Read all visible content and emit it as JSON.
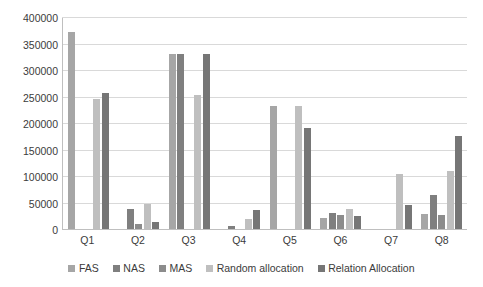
{
  "chart_data": {
    "type": "bar",
    "title": "",
    "subtitle": "",
    "xlabel": "",
    "ylabel": "",
    "grid": true,
    "legend_position": "bottom",
    "ylim": [
      0,
      400000
    ],
    "ytick_step": 50000,
    "yticks": [
      "0",
      "50000",
      "100000",
      "150000",
      "200000",
      "250000",
      "300000",
      "350000",
      "400000"
    ],
    "categories": [
      "Q1",
      "Q2",
      "Q3",
      "Q4",
      "Q5",
      "Q6",
      "Q7",
      "Q8"
    ],
    "series": [
      {
        "name": "FAS",
        "color": "#a6a6a6",
        "values": [
          372000,
          0,
          330000,
          0,
          232000,
          21000,
          0,
          28000
        ]
      },
      {
        "name": "NAS",
        "color": "#7f7f7f",
        "values": [
          0,
          38000,
          330000,
          5000,
          0,
          30000,
          0,
          65000
        ]
      },
      {
        "name": "MAS",
        "color": "#8c8c8c",
        "values": [
          0,
          9000,
          0,
          0,
          0,
          27000,
          0,
          27000
        ]
      },
      {
        "name": "Random allocation",
        "color": "#bfbfbf",
        "values": [
          246000,
          48000,
          252000,
          18000,
          232000,
          38000,
          103000,
          110000
        ]
      },
      {
        "name": "Relation Allocation",
        "color": "#767676",
        "values": [
          257000,
          13000,
          330000,
          35000,
          190000,
          24000,
          45000,
          175000
        ]
      }
    ]
  }
}
